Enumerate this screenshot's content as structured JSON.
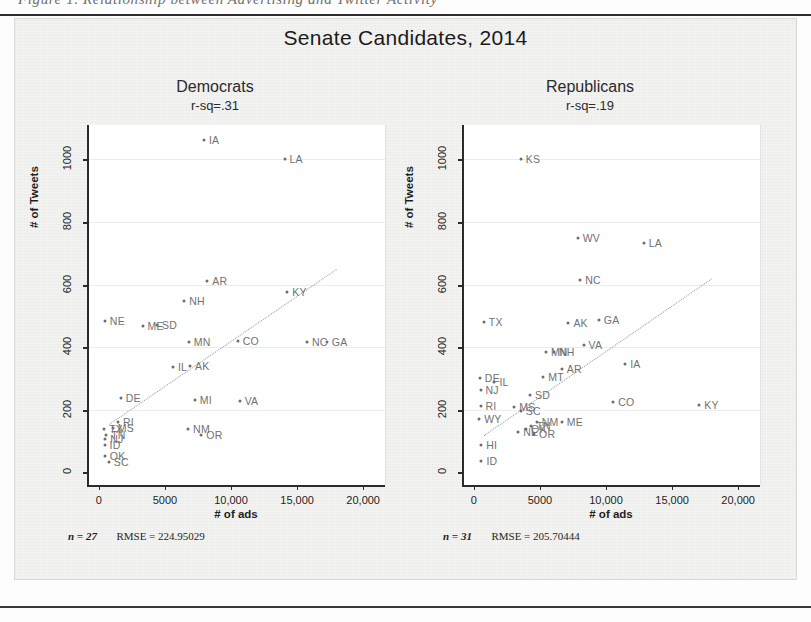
{
  "figure": {
    "cut_caption": "Figure 1.  Relationship between Advertising and Twitter Activity",
    "main_title": "Senate Candidates, 2014"
  },
  "axes": {
    "x_title": "# of ads",
    "y_title": "# of Tweets",
    "x_ticks": [
      "0",
      "5000",
      "10,000",
      "15,000",
      "20,000"
    ],
    "x_tick_values": [
      0,
      5000,
      10000,
      15000,
      20000
    ],
    "y_ticks": [
      "0",
      "200",
      "400",
      "600",
      "800",
      "1000"
    ],
    "y_tick_values": [
      0,
      200,
      400,
      600,
      800,
      1000
    ],
    "xlim": [
      -900,
      21500
    ],
    "ylim": [
      -40,
      1110
    ]
  },
  "panels": [
    {
      "key": "democrats",
      "title": "Democrats",
      "subtitle": "r-sq=.31",
      "n_label": "n = 27",
      "rmse_label": "RMSE =  224.95029",
      "n": 27,
      "rmse": 224.95029,
      "r_squared": 0.31
    },
    {
      "key": "republicans",
      "title": "Republicans",
      "subtitle": "r-sq=.19",
      "n_label": "n = 31",
      "rmse_label": "RMSE =  205.70444",
      "n": 31,
      "rmse": 205.70444,
      "r_squared": 0.19
    }
  ],
  "chart_data": [
    {
      "type": "scatter",
      "title": "Democrats",
      "subtitle": "r-sq=.31",
      "xlabel": "# of ads",
      "ylabel": "# of Tweets",
      "xlim": [
        -900,
        21500
      ],
      "ylim": [
        -40,
        1110
      ],
      "grid": true,
      "legend": "none",
      "point_labels": "state abbreviations",
      "annotations": [
        "n = 27",
        "RMSE =  224.95029"
      ],
      "fit_line": {
        "style": "dotted",
        "x": [
          600,
          17800
        ],
        "y": [
          155,
          650
        ]
      },
      "points": [
        {
          "label": "IA",
          "x": 7800,
          "y": 1062
        },
        {
          "label": "LA",
          "x": 13900,
          "y": 1000
        },
        {
          "label": "AR",
          "x": 8050,
          "y": 612
        },
        {
          "label": "KY",
          "x": 14100,
          "y": 575
        },
        {
          "label": "NH",
          "x": 6300,
          "y": 548
        },
        {
          "label": "NE",
          "x": 300,
          "y": 483
        },
        {
          "label": "ME",
          "x": 3150,
          "y": 468
        },
        {
          "label": "SD",
          "x": 4250,
          "y": 470
        },
        {
          "label": "MN",
          "x": 6650,
          "y": 418
        },
        {
          "label": "CO",
          "x": 10350,
          "y": 420
        },
        {
          "label": "NC",
          "x": 15600,
          "y": 418
        },
        {
          "label": "GA",
          "x": 17100,
          "y": 418
        },
        {
          "label": "IL",
          "x": 5450,
          "y": 338
        },
        {
          "label": "AK",
          "x": 6750,
          "y": 340
        },
        {
          "label": "DE",
          "x": 1500,
          "y": 238
        },
        {
          "label": "MI",
          "x": 7100,
          "y": 232
        },
        {
          "label": "VA",
          "x": 10500,
          "y": 228
        },
        {
          "label": "NM",
          "x": 6600,
          "y": 138
        },
        {
          "label": "OR",
          "x": 7600,
          "y": 120
        },
        {
          "label": "RI",
          "x": 1300,
          "y": 160
        },
        {
          "label": "MS",
          "x": 900,
          "y": 143
        },
        {
          "label": "TX",
          "x": 250,
          "y": 138
        },
        {
          "label": "TN",
          "x": 400,
          "y": 120
        },
        {
          "label": "NJ",
          "x": 330,
          "y": 108
        },
        {
          "label": "ID",
          "x": 280,
          "y": 88
        },
        {
          "label": "OK",
          "x": 300,
          "y": 52
        },
        {
          "label": "SC",
          "x": 600,
          "y": 32
        }
      ]
    },
    {
      "type": "scatter",
      "title": "Republicans",
      "subtitle": "r-sq=.19",
      "xlabel": "# of ads",
      "ylabel": "# of Tweets",
      "xlim": [
        -900,
        21500
      ],
      "ylim": [
        -40,
        1110
      ],
      "grid": true,
      "legend": "none",
      "point_labels": "state abbreviations",
      "annotations": [
        "n = 31",
        "RMSE =  205.70444"
      ],
      "fit_line": {
        "style": "dotted",
        "x": [
          600,
          17800
        ],
        "y": [
          120,
          620
        ]
      },
      "points": [
        {
          "label": "KS",
          "x": 3400,
          "y": 1000
        },
        {
          "label": "WV",
          "x": 7700,
          "y": 750
        },
        {
          "label": "LA",
          "x": 12700,
          "y": 733
        },
        {
          "label": "NC",
          "x": 7900,
          "y": 615
        },
        {
          "label": "TX",
          "x": 600,
          "y": 482
        },
        {
          "label": "AK",
          "x": 7000,
          "y": 478
        },
        {
          "label": "GA",
          "x": 9300,
          "y": 487
        },
        {
          "label": "VA",
          "x": 8150,
          "y": 407
        },
        {
          "label": "MN",
          "x": 5300,
          "y": 385
        },
        {
          "label": "NH",
          "x": 5900,
          "y": 385
        },
        {
          "label": "AR",
          "x": 6500,
          "y": 332
        },
        {
          "label": "IA",
          "x": 11300,
          "y": 345
        },
        {
          "label": "MT",
          "x": 5100,
          "y": 305
        },
        {
          "label": "DE",
          "x": 300,
          "y": 302
        },
        {
          "label": "IL",
          "x": 1400,
          "y": 290
        },
        {
          "label": "NJ",
          "x": 350,
          "y": 262
        },
        {
          "label": "SD",
          "x": 4100,
          "y": 248
        },
        {
          "label": "CO",
          "x": 10400,
          "y": 225
        },
        {
          "label": "KY",
          "x": 16900,
          "y": 215
        },
        {
          "label": "RI",
          "x": 350,
          "y": 212
        },
        {
          "label": "MS",
          "x": 2900,
          "y": 208
        },
        {
          "label": "SC",
          "x": 3400,
          "y": 195
        },
        {
          "label": "NM",
          "x": 4600,
          "y": 160
        },
        {
          "label": "TN",
          "x": 4200,
          "y": 148
        },
        {
          "label": "ME",
          "x": 6500,
          "y": 160
        },
        {
          "label": "NE",
          "x": 3200,
          "y": 128
        },
        {
          "label": "OR",
          "x": 4400,
          "y": 122
        },
        {
          "label": "HI",
          "x": 400,
          "y": 88
        },
        {
          "label": "ID",
          "x": 420,
          "y": 38
        },
        {
          "label": "WY",
          "x": 250,
          "y": 170
        },
        {
          "label": "OK",
          "x": 3800,
          "y": 140
        }
      ]
    }
  ]
}
